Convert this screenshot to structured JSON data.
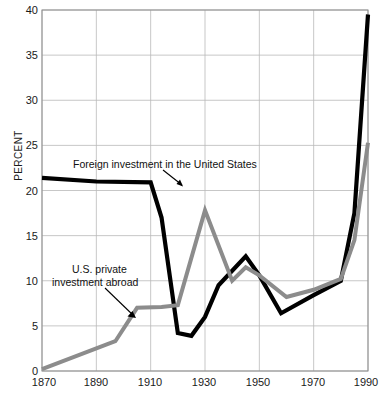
{
  "chart_data": {
    "type": "line",
    "title": "",
    "xlabel": "",
    "ylabel": "PERCENT",
    "xlim": [
      1870,
      1990
    ],
    "ylim": [
      0,
      40
    ],
    "xticks": [
      1870,
      1890,
      1910,
      1930,
      1950,
      1970,
      1990
    ],
    "yticks": [
      0,
      5,
      10,
      15,
      20,
      25,
      30,
      35,
      40
    ],
    "grid": true,
    "legend_position": "inline-annotations",
    "series": [
      {
        "name": "Foreign investment in the United States",
        "color": "#000000",
        "points": [
          [
            1870,
            21.4
          ],
          [
            1890,
            21.0
          ],
          [
            1910,
            20.9
          ],
          [
            1914,
            17.0
          ],
          [
            1920,
            4.2
          ],
          [
            1925,
            3.9
          ],
          [
            1930,
            6.0
          ],
          [
            1935,
            9.5
          ],
          [
            1945,
            12.7
          ],
          [
            1950,
            10.6
          ],
          [
            1958,
            6.4
          ],
          [
            1970,
            8.4
          ],
          [
            1980,
            10.0
          ],
          [
            1985,
            17.5
          ],
          [
            1990,
            39.5
          ]
        ]
      },
      {
        "name": "U.S. private investment abroad",
        "color": "#8c8c8c",
        "points": [
          [
            1870,
            0.2
          ],
          [
            1890,
            2.5
          ],
          [
            1897,
            3.3
          ],
          [
            1905,
            7.0
          ],
          [
            1914,
            7.1
          ],
          [
            1920,
            7.3
          ],
          [
            1930,
            17.8
          ],
          [
            1940,
            10.0
          ],
          [
            1945,
            11.5
          ],
          [
            1950,
            10.6
          ],
          [
            1960,
            8.2
          ],
          [
            1970,
            9.0
          ],
          [
            1980,
            10.2
          ],
          [
            1985,
            14.5
          ],
          [
            1990,
            25.3
          ]
        ]
      }
    ],
    "annotations": [
      {
        "id": "foreign-investment-label",
        "text": "Foreign investment in the United States",
        "x": 73,
        "y": 164
      },
      {
        "id": "us-private-label-line1",
        "text": "U.S. private",
        "x": 72,
        "y": 269
      },
      {
        "id": "us-private-label-line2",
        "text": "investment abroad",
        "x": 52,
        "y": 282
      }
    ]
  },
  "axis": {
    "ylabel": "PERCENT",
    "ytick_labels": [
      "0",
      "5",
      "10",
      "15",
      "20",
      "25",
      "30",
      "35",
      "40"
    ],
    "xtick_labels": [
      "1870",
      "1890",
      "1910",
      "1930",
      "1950",
      "1970",
      "1990"
    ]
  },
  "colors": {
    "series_black": "#000000",
    "series_gray": "#8c8c8c",
    "grid": "#b9b9b9",
    "axis": "#8d8d8d",
    "text": "#1a1a1a",
    "background": "#ffffff"
  }
}
